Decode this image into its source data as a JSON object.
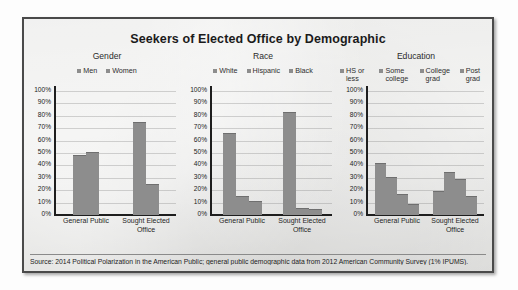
{
  "title": "Seekers of Elected Office by Demographic",
  "source": "Source: 2014 Political Polarization in the American Public; general public demographic data from 2012 American Community Survey (1% IPUMS).",
  "axis": {
    "ticks": [
      "100%",
      "90%",
      "80%",
      "70%",
      "60%",
      "50%",
      "40%",
      "30%",
      "20%",
      "10%",
      "0%"
    ],
    "ylim": [
      0,
      100
    ],
    "categories": [
      "General Public",
      "Sought Elected Office"
    ]
  },
  "colors": {
    "bar": "#8d8d8d",
    "frame": "#4a4a4a",
    "paper": "#e9e9e7",
    "axis": "#1e1e1e"
  },
  "panels": [
    {
      "name": "gender",
      "title": "Gender",
      "legend": [
        "Men",
        "Women"
      ]
    },
    {
      "name": "race",
      "title": "Race",
      "legend": [
        "White",
        "Hispanic",
        "Black"
      ]
    },
    {
      "name": "education",
      "title": "Education",
      "legend": [
        "HS or less",
        "Some college",
        "College grad",
        "Post grad"
      ]
    }
  ],
  "chart_data": [
    {
      "type": "bar",
      "title": "Gender",
      "xlabel": "",
      "ylabel": "",
      "ylim": [
        0,
        100
      ],
      "grid": true,
      "legend_position": "top",
      "categories": [
        "General Public",
        "Sought Elected Office"
      ],
      "series": [
        {
          "name": "Men",
          "values": [
            48,
            75
          ]
        },
        {
          "name": "Women",
          "values": [
            51,
            25
          ]
        }
      ]
    },
    {
      "type": "bar",
      "title": "Race",
      "xlabel": "",
      "ylabel": "",
      "ylim": [
        0,
        100
      ],
      "grid": true,
      "legend_position": "top",
      "categories": [
        "General Public",
        "Sought Elected Office"
      ],
      "series": [
        {
          "name": "White",
          "values": [
            66,
            83
          ]
        },
        {
          "name": "Hispanic",
          "values": [
            15,
            6
          ]
        },
        {
          "name": "Black",
          "values": [
            11,
            5
          ]
        }
      ]
    },
    {
      "type": "bar",
      "title": "Education",
      "xlabel": "",
      "ylabel": "",
      "ylim": [
        0,
        100
      ],
      "grid": true,
      "legend_position": "top",
      "categories": [
        "General Public",
        "Sought Elected Office"
      ],
      "series": [
        {
          "name": "HS or less",
          "values": [
            42,
            19
          ]
        },
        {
          "name": "Some college",
          "values": [
            31,
            35
          ]
        },
        {
          "name": "College grad",
          "values": [
            17,
            29
          ]
        },
        {
          "name": "Post grad",
          "values": [
            9,
            15
          ]
        }
      ]
    }
  ]
}
